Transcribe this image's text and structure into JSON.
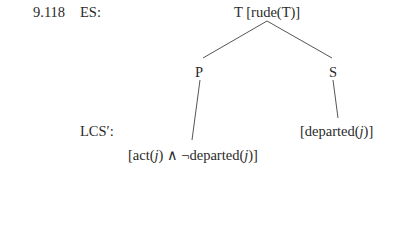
{
  "example_number": "9.118",
  "labels": {
    "es": "ES:",
    "lcs": "LCS′:"
  },
  "tree": {
    "root": "T [rude(T)]",
    "left": "P",
    "right": "S",
    "left_lcs_prefix": "[act(",
    "var": "j",
    "left_lcs_mid": ") ∧ ¬departed(",
    "left_lcs_suffix": ")]",
    "right_lcs_prefix": "[departed(",
    "right_lcs_suffix": ")]"
  }
}
